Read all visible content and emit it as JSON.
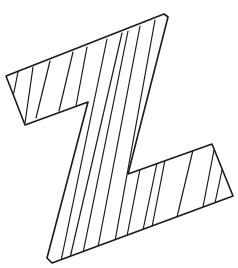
{
  "figure": {
    "title": "Hatched letter Z",
    "letter": "Z",
    "stroke_color": "#1a1a1a",
    "background_color": "#ffffff",
    "outline_points": "6,76 164,14 168,17 128,174 212,144 233,196 52,263 47,258 88,102 25,125",
    "hatch_lines": [
      {
        "x1": 18,
        "y1": 72,
        "x2": 13,
        "y2": 97
      },
      {
        "x1": 33,
        "y1": 67,
        "x2": 25,
        "y2": 123
      },
      {
        "x1": 50,
        "y1": 61,
        "x2": 36,
        "y2": 118
      },
      {
        "x1": 73,
        "y1": 52,
        "x2": 59,
        "y2": 111
      },
      {
        "x1": 87,
        "y1": 47,
        "x2": 76,
        "y2": 106
      },
      {
        "x1": 107,
        "y1": 39,
        "x2": 61,
        "y2": 261
      },
      {
        "x1": 122,
        "y1": 33,
        "x2": 70,
        "y2": 258
      },
      {
        "x1": 128,
        "y1": 31,
        "x2": 83,
        "y2": 253
      },
      {
        "x1": 140,
        "y1": 26,
        "x2": 98,
        "y2": 247
      },
      {
        "x1": 155,
        "y1": 20,
        "x2": 115,
        "y2": 241
      },
      {
        "x1": 140,
        "y1": 169,
        "x2": 127,
        "y2": 236
      },
      {
        "x1": 157,
        "y1": 163,
        "x2": 143,
        "y2": 230
      },
      {
        "x1": 165,
        "y1": 160,
        "x2": 152,
        "y2": 227
      },
      {
        "x1": 193,
        "y1": 150,
        "x2": 177,
        "y2": 217
      },
      {
        "x1": 214,
        "y1": 150,
        "x2": 203,
        "y2": 207
      },
      {
        "x1": 222,
        "y1": 170,
        "x2": 215,
        "y2": 203
      }
    ]
  }
}
